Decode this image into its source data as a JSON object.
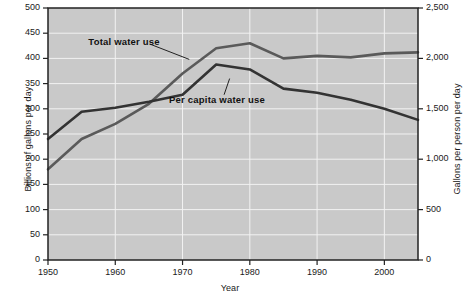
{
  "chart_data": {
    "type": "line",
    "title": "",
    "xlabel": "Year",
    "ylabel": "Billions of gallons per day",
    "ylabel_right": "Gallons per person per day",
    "x": [
      1950,
      1955,
      1960,
      1965,
      1970,
      1975,
      1980,
      1985,
      1990,
      1995,
      2000,
      2005
    ],
    "xlim": [
      1950,
      2005
    ],
    "ylim": [
      0,
      500
    ],
    "ylim_right": [
      0,
      2500
    ],
    "xticks": [
      "1950",
      "1960",
      "1970",
      "1980",
      "1990",
      "2000"
    ],
    "xtick_values": [
      1950,
      1960,
      1970,
      1980,
      1990,
      2000
    ],
    "yticks_left": [
      "0",
      "50",
      "100",
      "150",
      "200",
      "250",
      "300",
      "350",
      "400",
      "450",
      "500"
    ],
    "ytick_values_left": [
      0,
      50,
      100,
      150,
      200,
      250,
      300,
      350,
      400,
      450,
      500
    ],
    "yticks_right": [
      "0",
      "500",
      "1,000",
      "1,500",
      "2,000",
      "2,500"
    ],
    "ytick_values_right": [
      0,
      500,
      1000,
      1500,
      2000,
      2500
    ],
    "grid": true,
    "grid_color": "#f2f2f2",
    "plot_background": "#c9c9c9",
    "legend_position": "inline-annotation",
    "series": [
      {
        "name": "Total water use",
        "axis": "left",
        "units": "Billions of gallons per day",
        "color": "#5a5a5a",
        "values": [
          180,
          240,
          270,
          310,
          370,
          420,
          430,
          400,
          405,
          402,
          410,
          412
        ]
      },
      {
        "name": "Per capita water use",
        "axis": "right",
        "units": "Gallons per person per day",
        "color": "#333333",
        "values": [
          1200,
          1470,
          1510,
          1570,
          1640,
          1940,
          1890,
          1700,
          1660,
          1590,
          1500,
          1390
        ]
      }
    ],
    "annotations": [
      {
        "text": "Total water use",
        "x": 1956,
        "y": 432,
        "leader_to_x": 1971,
        "leader_to_y": 398
      },
      {
        "text": "Per capita water use",
        "x": 1968,
        "y": 318,
        "leader_to_x": 1977,
        "leader_to_y": 360
      }
    ]
  }
}
